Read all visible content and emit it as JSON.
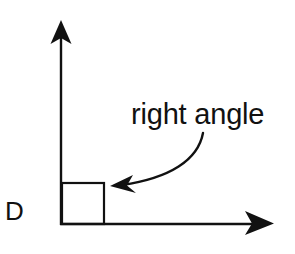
{
  "diagram": {
    "type": "geometry-angle",
    "vertex": {
      "label": "D"
    },
    "annotation": {
      "text": "right angle"
    },
    "rays": [
      {
        "name": "vertical-ray",
        "direction": "up"
      },
      {
        "name": "horizontal-ray",
        "direction": "right"
      }
    ],
    "angle_marker": "square",
    "colors": {
      "stroke": "#111111",
      "background": "#ffffff"
    }
  }
}
